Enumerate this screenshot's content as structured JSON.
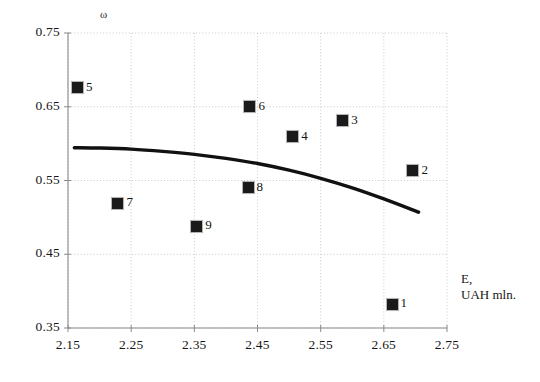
{
  "chart_data": {
    "type": "scatter",
    "title": "",
    "xlabel": "E, UAH mln.",
    "ylabel": "ω",
    "xlim": [
      2.15,
      2.75
    ],
    "ylim": [
      0.35,
      0.75
    ],
    "xticks": [
      "2.15",
      "2.25",
      "2.35",
      "2.45",
      "2.55",
      "2.65",
      "2.75"
    ],
    "yticks": [
      "0.75",
      "0.65",
      "0.55",
      "0.45",
      "0.35"
    ],
    "grid": true,
    "legend": "none",
    "points": [
      {
        "label": "5",
        "x": 2.165,
        "y": 0.676
      },
      {
        "label": "7",
        "x": 2.229,
        "y": 0.519
      },
      {
        "label": "9",
        "x": 2.354,
        "y": 0.488
      },
      {
        "label": "8",
        "x": 2.435,
        "y": 0.54
      },
      {
        "label": "6",
        "x": 2.438,
        "y": 0.65
      },
      {
        "label": "4",
        "x": 2.506,
        "y": 0.609
      },
      {
        "label": "3",
        "x": 2.585,
        "y": 0.631
      },
      {
        "label": "2",
        "x": 2.696,
        "y": 0.563
      },
      {
        "label": "1",
        "x": 2.663,
        "y": 0.382
      }
    ],
    "curve": {
      "name": "regression-curve",
      "x": [
        2.16,
        2.2,
        2.25,
        2.3,
        2.35,
        2.4,
        2.45,
        2.5,
        2.55,
        2.6,
        2.65,
        2.705
      ],
      "y": [
        0.5945,
        0.594,
        0.5925,
        0.5895,
        0.5855,
        0.58,
        0.573,
        0.564,
        0.553,
        0.54,
        0.525,
        0.507
      ]
    }
  },
  "colors": {
    "marker": "#1a1a1a",
    "curve": "#111111",
    "grid": "#bdbdbd",
    "axis": "#8a8a8a",
    "text": "#161616"
  }
}
